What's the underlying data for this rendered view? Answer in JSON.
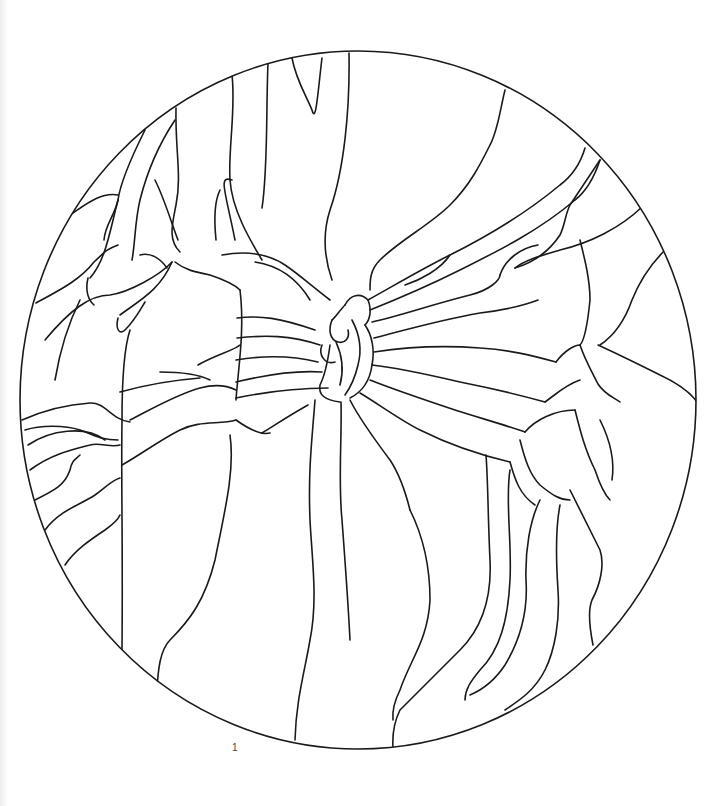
{
  "page": {
    "page_number": "1",
    "background": "#ffffff",
    "line_color": "#1a1a1a"
  },
  "artwork": {
    "subject": "stained-glass-pattern-flower-in-circle",
    "frame": {
      "cx": 358,
      "cy": 400,
      "rx": 338,
      "ry": 349
    },
    "paths": [
      "M232,75 C236,110 228,150 230,180 C232,210 250,240 262,260",
      "M268,63 C266,110 268,170 262,208",
      "M292,58 C296,80 306,95 312,110 C316,125 318,90 322,58",
      "M349,53 C350,110 344,170 330,210 C322,235 325,260 332,280",
      "M176,108 C175,150 182,175 176,205 C172,225 168,240 180,252",
      "M145,130 C130,160 120,185 118,200 C115,215 105,225 104,240",
      "M175,120 C165,135 150,160 140,200 C135,220 135,245 132,260",
      "M70,215 C85,205 100,192 118,195",
      "M36,303 C60,290 80,280 94,262 C105,252 105,250 118,245",
      "M118,200 C110,230 106,260 90,278",
      "M88,278 C85,290 88,300 94,305",
      "M155,180 C165,200 172,225 178,240",
      "M140,255 C150,252 160,258 167,268",
      "M120,315 C140,300 160,290 172,262",
      "M45,340 C70,310 90,295 110,295 C130,292 160,275 172,262",
      "M118,318 C115,330 120,335 125,330 C135,320 140,310 145,302",
      "M130,330 C125,345 122,380 122,420 C121,480 123,540 122,650",
      "M80,300 C70,320 60,350 55,380",
      "M175,262 C185,270 195,272 210,275 C225,280 235,285 240,290",
      "M240,290 C245,330 238,370 236,400",
      "M235,240 C225,190 218,175 232,180",
      "M220,190 C215,200 214,220 216,240",
      "M222,255 C250,250 270,255 285,265 C300,275 310,285 330,300",
      "M255,262 C275,265 295,275 310,300",
      "M237,318 C260,315 280,318 315,330",
      "M237,338 C265,335 290,335 320,345",
      "M236,360 C260,356 290,355 318,362",
      "M236,382 C265,375 295,370 322,372",
      "M236,398 C265,392 300,388 328,388",
      "M198,365 C215,355 235,350 240,345",
      "M160,372 C180,372 200,375 210,380",
      "M120,392 C145,385 175,380 200,378",
      "M22,420 C40,412 60,405 90,403 C105,402 112,420 130,422",
      "M25,430 C40,425 65,425 80,430 C95,435 100,440 118,440",
      "M28,445 C50,430 85,425 105,440",
      "M30,470 C50,455 70,450 90,445 C100,442 110,448 120,445",
      "M35,500 C55,490 65,485 70,470 C72,460 75,460 80,455",
      "M45,530 C60,510 80,505 95,495 C105,488 112,480 120,478",
      "M65,565 C75,550 90,540 105,530 C112,525 118,520 120,515",
      "M130,420 C150,410 175,395 200,388 C215,384 228,386 236,390",
      "M122,465 C140,455 160,440 180,430 C200,420 220,425 236,420",
      "M236,420 C250,430 262,435 270,433",
      "M262,433 C275,425 290,415 308,405",
      "M230,435 C235,470 225,510 215,560 C205,600 190,620 170,640 C160,650 158,670 157,690",
      "M315,400 C312,440 308,470 310,520 C312,560 318,600 310,640 C305,670 296,700 295,740",
      "M341,402 C342,440 338,480 342,520 C345,560 348,600 350,640",
      "M345,305 C350,295 360,292 368,300 C372,310 370,320 365,325",
      "M332,320 C328,330 330,340 338,342 C345,344 350,338 348,330",
      "M322,345 C318,355 325,365 335,362",
      "M345,305 C340,310 335,318 332,320",
      "M365,325 C372,335 375,350 372,365 C370,380 362,392 350,398",
      "M330,345 C328,360 325,375 320,385 C318,395 325,400 340,402",
      "M352,320 C360,335 362,350 358,365 C355,378 350,388 345,395",
      "M336,342 C342,355 344,370 340,385",
      "M368,300 C395,285 420,270 450,255 C490,235 530,210 560,185 C572,176 580,165 585,148",
      "M370,310 C400,298 430,285 460,270 C500,250 540,230 575,200 C588,190 595,175 600,160",
      "M372,322 C400,316 430,305 470,295 C490,290 500,280 500,275",
      "M374,338 C405,330 440,320 480,313 C505,310 525,305 538,300",
      "M374,352 C400,348 440,345 480,348 C510,350 530,355 556,362",
      "M372,365 C400,368 430,375 460,382 C490,388 520,395 545,402",
      "M370,380 C395,390 425,400 455,410 C480,418 505,425 525,432",
      "M360,393 C380,405 400,420 420,430 C450,445 480,455 510,462",
      "M350,400 C360,420 375,440 390,460 C400,475 405,490 410,510",
      "M505,90 C500,110 498,130 490,145 C480,165 470,185 450,205 C430,225 400,240 380,260 C370,270 370,280 370,290",
      "M405,285 C420,280 440,270 450,255",
      "M600,160 C590,175 580,190 570,205 C565,215 565,225 560,235 C550,250 535,262 515,268",
      "M515,268 C525,260 540,256 560,250 C590,243 620,228 642,207",
      "M500,275 C505,260 520,248 538,245",
      "M580,240 C585,260 590,280 590,300 C588,320 585,340 580,345",
      "M580,345 C585,360 592,372 598,384 C605,395 615,398 620,402",
      "M665,250 C650,265 640,280 632,300 C625,320 615,335 600,345",
      "M598,345 C620,355 640,365 660,375 C675,382 690,392 697,402",
      "M556,362 C565,350 575,345 580,345",
      "M545,402 C555,395 565,385 580,380",
      "M525,432 C535,420 555,410 575,410",
      "M575,410 C580,430 585,450 595,470 C600,485 605,495 610,500",
      "M600,420 C610,440 615,460 612,480",
      "M520,440 C525,460 530,475 540,485 C552,495 560,500 570,500",
      "M510,462 C515,480 520,495 535,505",
      "M486,455 C488,480 488,520 490,560 C492,600 480,630 460,650 C440,670 420,690 400,710 C395,720 392,732 393,748",
      "M510,470 C505,500 512,540 510,580 C508,620 500,650 480,670 C470,682 465,690 465,700",
      "M540,500 C530,520 525,550 526,580 C528,610 520,640 505,665 C495,680 482,690 470,695",
      "M560,505 C555,530 556,560 558,590 C560,620 555,650 545,670 C535,690 520,700 505,710",
      "M570,490 C580,510 590,530 600,550 C605,565 600,585 592,600 C587,612 590,630 593,645",
      "M410,510 C420,530 430,560 430,600 C428,640 410,660 400,690 C395,700 392,710 393,720"
    ]
  }
}
